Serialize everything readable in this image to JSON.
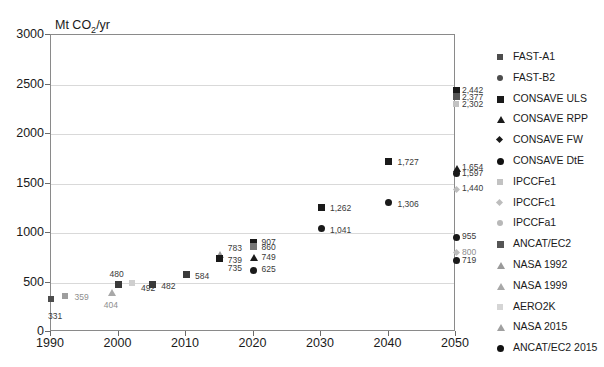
{
  "chart_data": {
    "type": "scatter",
    "title": "",
    "ylabel": "Mt CO2/yr",
    "ylabel_display": "Mt CO",
    "ylabel_sub": "2",
    "ylabel_tail": "/yr",
    "xlabel": "",
    "xlim": [
      1990,
      2050
    ],
    "ylim": [
      0,
      3000
    ],
    "grid": true,
    "yticks": [
      "0",
      "500",
      "1000",
      "1500",
      "2000",
      "2500",
      "3000"
    ],
    "ytick_values": [
      0,
      500,
      1000,
      1500,
      2000,
      2500,
      3000
    ],
    "xticks": [
      "1990",
      "2000",
      "2010",
      "2020",
      "2030",
      "2040",
      "2050"
    ],
    "xtick_values": [
      1990,
      2000,
      2010,
      2020,
      2030,
      2040,
      2050
    ],
    "legend_position": "right",
    "series": [
      {
        "name": "FAST-A1",
        "marker": "square",
        "color": "#4d4d4d",
        "points": [
          {
            "x": 2050,
            "y": 2442,
            "label": "2,442"
          }
        ]
      },
      {
        "name": "FAST-B2",
        "marker": "circle",
        "color": "#4d4d4d",
        "points": [
          {
            "x": 2050,
            "y": 1597,
            "label": "1,597"
          },
          {
            "x": 2030,
            "y": 1041,
            "label": "1,041"
          },
          {
            "x": 2040,
            "y": 1306,
            "label": "1,306"
          },
          {
            "x": 2020,
            "y": 625,
            "label": "625"
          }
        ]
      },
      {
        "name": "CONSAVE ULS",
        "marker": "bigsquare",
        "color": "#1a1a1a",
        "points": [
          {
            "x": 2020,
            "y": 907,
            "label": "907"
          },
          {
            "x": 2040,
            "y": 1727,
            "label": "1,727"
          },
          {
            "x": 2030,
            "y": 1262,
            "label": "1,262"
          },
          {
            "x": 2015,
            "y": 739,
            "label": "739"
          }
        ]
      },
      {
        "name": "CONSAVE RPP",
        "marker": "tri",
        "color": "#1a1a1a",
        "points": [
          {
            "x": 2020,
            "y": 749,
            "label": "749"
          },
          {
            "x": 2050,
            "y": 1654,
            "label": "1,654"
          }
        ]
      },
      {
        "name": "CONSAVE FW",
        "marker": "dia",
        "color": "#1a1a1a",
        "points": []
      },
      {
        "name": "CONSAVE  DtE",
        "marker": "bigcircle",
        "color": "#111111",
        "points": [
          {
            "x": 2050,
            "y": 719,
            "label": "719"
          },
          {
            "x": 2050,
            "y": 955,
            "label": "955"
          }
        ]
      },
      {
        "name": "IPCCFe1",
        "marker": "square",
        "color": "#c2c2c2",
        "points": [
          {
            "x": 2050,
            "y": 2302,
            "label": "2,302"
          },
          {
            "x": 2015,
            "y": 735,
            "label": "735"
          }
        ]
      },
      {
        "name": "IPCCFc1",
        "marker": "dia",
        "color": "#bdbdbd",
        "points": [
          {
            "x": 2050,
            "y": 1440,
            "label": "1,440"
          },
          {
            "x": 2050,
            "y": 800,
            "label": "800"
          }
        ]
      },
      {
        "name": "IPCCFa1",
        "marker": "circle",
        "color": "#b8b8b8",
        "points": []
      },
      {
        "name": "ANCAT/EC2",
        "marker": "bigsquare",
        "color": "#555555",
        "points": [
          {
            "x": 2050,
            "y": 2377,
            "label": "2,377"
          },
          {
            "x": 2020,
            "y": 860,
            "label": "860"
          }
        ]
      },
      {
        "name": "NASA 1992",
        "marker": "tri",
        "color": "#9a9a9a",
        "points": [
          {
            "x": 1999,
            "y": 404,
            "label": "404"
          }
        ]
      },
      {
        "name": "NASA 1999",
        "marker": "tri",
        "color": "#a8a8a8",
        "points": [
          {
            "x": 2015,
            "y": 783,
            "label": "783"
          }
        ]
      },
      {
        "name": "AERO2K",
        "marker": "square",
        "color": "#d5d5d5",
        "points": [
          {
            "x": 1992,
            "y": 359,
            "label": "359"
          },
          {
            "x": 2002,
            "y": 492,
            "label": "492"
          }
        ]
      },
      {
        "name": "NASA 2015",
        "marker": "tri",
        "color": "#a0a0a0",
        "points": []
      },
      {
        "name": "ANCAT/EC2 2015",
        "marker": "bigcircle",
        "color": "#111111",
        "points": []
      }
    ],
    "plotted_points": [
      {
        "x": 1990,
        "y": 331,
        "label": "331",
        "marker": "square",
        "color": "#4d4d4d",
        "lx": -2,
        "ly": 14,
        "lite": false
      },
      {
        "x": 1992,
        "y": 359,
        "label": "359",
        "marker": "square",
        "color": "#9e9e9e",
        "lx": 11,
        "ly": -2,
        "lite": true
      },
      {
        "x": 1999,
        "y": 404,
        "label": "404",
        "marker": "tri",
        "color": "#a8a8a8",
        "lx": -7,
        "ly": 10,
        "lite": true
      },
      {
        "x": 2000,
        "y": 480,
        "label": "480",
        "marker": "bigsquare",
        "color": "#3a3a3a",
        "lx": -8,
        "ly": -13,
        "lite": false
      },
      {
        "x": 2002,
        "y": 492,
        "label": "492",
        "marker": "square",
        "color": "#cfcfcf",
        "lx": 10,
        "ly": 2,
        "lite": false
      },
      {
        "x": 2005,
        "y": 482,
        "label": "482",
        "marker": "bigsquare",
        "color": "#3a3a3a",
        "lx": 10,
        "ly": -1,
        "lite": false
      },
      {
        "x": 2010,
        "y": 584,
        "label": "584",
        "marker": "bigsquare",
        "color": "#3a3a3a",
        "lx": 10,
        "ly": -1,
        "lite": false
      },
      {
        "x": 2015,
        "y": 783,
        "label": "783",
        "marker": "tri",
        "color": "#9a9a9a",
        "lx": 9,
        "ly": -9,
        "lite": false
      },
      {
        "x": 2015,
        "y": 739,
        "label": "739",
        "marker": "bigsquare",
        "color": "#1a1a1a",
        "lx": 9,
        "ly": -2,
        "lite": false
      },
      {
        "x": 2015,
        "y": 735,
        "label": "735",
        "marker": "none",
        "color": "#c2c2c2",
        "lx": 9,
        "ly": 6,
        "lite": false
      },
      {
        "x": 2020,
        "y": 907,
        "label": "907",
        "marker": "bigsquare",
        "color": "#1a1a1a",
        "lx": 9,
        "ly": -3,
        "lite": false
      },
      {
        "x": 2020,
        "y": 860,
        "label": "860",
        "marker": "bigsquare",
        "color": "#777777",
        "lx": 9,
        "ly": -3,
        "lite": false
      },
      {
        "x": 2020,
        "y": 749,
        "label": "749",
        "marker": "tri",
        "color": "#1a1a1a",
        "lx": 9,
        "ly": -4,
        "lite": false
      },
      {
        "x": 2020,
        "y": 625,
        "label": "625",
        "marker": "bigcircle",
        "color": "#1a1a1a",
        "lx": 9,
        "ly": -4,
        "lite": false
      },
      {
        "x": 2030,
        "y": 1262,
        "label": "1,262",
        "marker": "bigsquare",
        "color": "#1a1a1a",
        "lx": 10,
        "ly": -2,
        "lite": false
      },
      {
        "x": 2030,
        "y": 1041,
        "label": "1,041",
        "marker": "bigcircle",
        "color": "#1a1a1a",
        "lx": 10,
        "ly": -2,
        "lite": false
      },
      {
        "x": 2040,
        "y": 1727,
        "label": "1,727",
        "marker": "bigsquare",
        "color": "#1a1a1a",
        "lx": 10,
        "ly": -2,
        "lite": false
      },
      {
        "x": 2040,
        "y": 1306,
        "label": "1,306",
        "marker": "bigcircle",
        "color": "#1a1a1a",
        "lx": 10,
        "ly": -2,
        "lite": false
      },
      {
        "x": 2050,
        "y": 2442,
        "label": "2,442",
        "marker": "bigsquare",
        "color": "#1a1a1a",
        "lx": 7,
        "ly": -3,
        "lite": false
      },
      {
        "x": 2050,
        "y": 2377,
        "label": "2,377",
        "marker": "bigsquare",
        "color": "#555555",
        "lx": 7,
        "ly": -3,
        "lite": false
      },
      {
        "x": 2050,
        "y": 2302,
        "label": "2,302",
        "marker": "square",
        "color": "#c2c2c2",
        "lx": 7,
        "ly": -3,
        "lite": false
      },
      {
        "x": 2050,
        "y": 1654,
        "label": "1,654",
        "marker": "tri",
        "color": "#1a1a1a",
        "lx": 7,
        "ly": -4,
        "lite": false
      },
      {
        "x": 2050,
        "y": 1597,
        "label": "1,597",
        "marker": "bigcircle",
        "color": "#1a1a1a",
        "lx": 7,
        "ly": -4,
        "lite": false
      },
      {
        "x": 2050,
        "y": 1440,
        "label": "1,440",
        "marker": "dia",
        "color": "#bdbdbd",
        "lx": 7,
        "ly": -4,
        "lite": false
      },
      {
        "x": 2050,
        "y": 955,
        "label": "955",
        "marker": "bigcircle",
        "color": "#1a1a1a",
        "lx": 7,
        "ly": -4,
        "lite": false
      },
      {
        "x": 2050,
        "y": 800,
        "label": "800",
        "marker": "dia",
        "color": "#bdbdbd",
        "lx": 7,
        "ly": -4,
        "lite": true
      },
      {
        "x": 2050,
        "y": 719,
        "label": "719",
        "marker": "bigcircle",
        "color": "#1a1a1a",
        "lx": 7,
        "ly": -4,
        "lite": false
      }
    ]
  },
  "legend": {
    "items": [
      {
        "label": "FAST-A1",
        "marker": "square",
        "color": "#4d4d4d"
      },
      {
        "label": "FAST-B2",
        "marker": "circle",
        "color": "#4d4d4d"
      },
      {
        "label": "CONSAVE ULS",
        "marker": "bigsquare",
        "color": "#1a1a1a"
      },
      {
        "label": "CONSAVE RPP",
        "marker": "tri",
        "color": "#1a1a1a"
      },
      {
        "label": "CONSAVE FW",
        "marker": "dia",
        "color": "#1a1a1a"
      },
      {
        "label": "CONSAVE  DtE",
        "marker": "bigcircle",
        "color": "#111111"
      },
      {
        "label": "IPCCFe1",
        "marker": "square",
        "color": "#c2c2c2"
      },
      {
        "label": "IPCCFc1",
        "marker": "dia",
        "color": "#bdbdbd"
      },
      {
        "label": "IPCCFa1",
        "marker": "circle",
        "color": "#b8b8b8"
      },
      {
        "label": "ANCAT/EC2",
        "marker": "bigsquare",
        "color": "#555555"
      },
      {
        "label": "NASA 1992",
        "marker": "tri",
        "color": "#9a9a9a"
      },
      {
        "label": "NASA 1999",
        "marker": "tri",
        "color": "#a8a8a8"
      },
      {
        "label": "AERO2K",
        "marker": "square",
        "color": "#d5d5d5"
      },
      {
        "label": "NASA 2015",
        "marker": "tri",
        "color": "#a0a0a0"
      },
      {
        "label": "ANCAT/EC2 2015",
        "marker": "bigcircle",
        "color": "#111111"
      }
    ]
  }
}
